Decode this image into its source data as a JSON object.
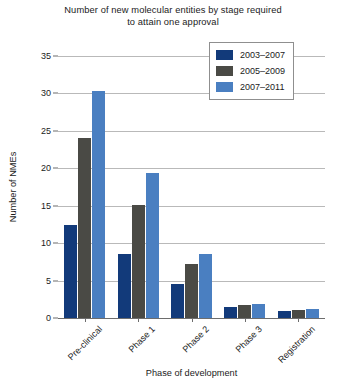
{
  "chart_data": {
    "type": "bar",
    "title": "Number of new molecular entities by stage required to attain one approval",
    "title_line1": "Number of new molecular entities by stage required",
    "title_line2": "to attain one approval",
    "xlabel": "Phase of development",
    "ylabel": "Number of NMEs",
    "ylim": [
      0,
      35
    ],
    "ytick_step": 5,
    "yticks": [
      0,
      5,
      10,
      15,
      20,
      25,
      30,
      35
    ],
    "ytick_labels": [
      "0",
      "5",
      "10",
      "15",
      "20",
      "25",
      "30",
      "35"
    ],
    "grid": true,
    "legend_position": "top-right",
    "categories": [
      "Pre-clinical",
      "Phase 1",
      "Phase 2",
      "Phase 3",
      "Registration"
    ],
    "series": [
      {
        "name": "2003–2007",
        "color": "#123A7A",
        "values": [
          12.4,
          8.6,
          4.5,
          1.5,
          1.0
        ]
      },
      {
        "name": "2005–2009",
        "color": "#4A4A45",
        "values": [
          24.0,
          15.1,
          7.2,
          1.7,
          1.1
        ]
      },
      {
        "name": "2007–2011",
        "color": "#4A7FC1",
        "values": [
          30.3,
          19.4,
          8.5,
          1.9,
          1.2
        ]
      }
    ]
  },
  "colors": {
    "series_1": "#123A7A",
    "series_2": "#4A4A45",
    "series_3": "#4A7FC1",
    "gridline": "#b9b9b9",
    "axis": "#6d6d6d",
    "text": "#1b1b1b",
    "background": "#ffffff"
  }
}
